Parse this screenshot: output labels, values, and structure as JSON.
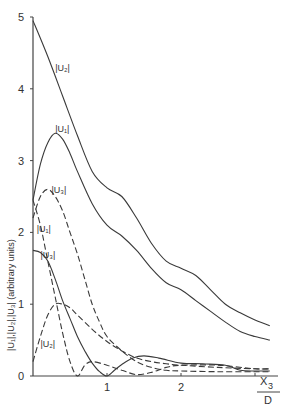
{
  "chart_data": {
    "type": "line",
    "title": "",
    "xlabel": "X3/D",
    "xlabel_numerator": "X",
    "xlabel_subscript": "3",
    "xlabel_denominator": "D",
    "ylabel": "|U1|,|U2|,|U3| (arbitrary units)",
    "ylabel_text": "|U₁|,|U₂|,|U₃| (arbitrary units)",
    "xlim": [
      0,
      3.3
    ],
    "ylim": [
      0,
      5
    ],
    "x_ticks": [
      0,
      1,
      2,
      3
    ],
    "x_tick_labels": [
      "",
      "1",
      "2",
      ""
    ],
    "y_ticks": [
      0,
      1,
      2,
      3,
      4,
      5
    ],
    "y_tick_labels": [
      "0",
      "1",
      "2",
      "3",
      "4",
      "5"
    ],
    "grid": false,
    "legend": "inline curve labels",
    "series": [
      {
        "name": "|U2| (upper solid)",
        "label": "|U₂|",
        "style": "solid",
        "label_pos": [
          0.3,
          4.25
        ],
        "x": [
          0,
          0.2,
          0.4,
          0.6,
          0.8,
          1.0,
          1.2,
          1.4,
          1.6,
          1.8,
          2.0,
          2.2,
          2.4,
          2.6,
          2.8,
          3.0,
          3.2
        ],
        "y": [
          4.95,
          4.45,
          3.9,
          3.35,
          2.85,
          2.62,
          2.5,
          2.2,
          1.85,
          1.6,
          1.5,
          1.4,
          1.2,
          1.0,
          0.88,
          0.78,
          0.7
        ]
      },
      {
        "name": "|U1| (lower solid)",
        "label": "|U₁|",
        "style": "solid",
        "label_pos": [
          0.3,
          3.4
        ],
        "x": [
          0,
          0.1,
          0.2,
          0.3,
          0.4,
          0.5,
          0.6,
          0.8,
          1.0,
          1.2,
          1.4,
          1.6,
          1.8,
          2.0,
          2.2,
          2.4,
          2.6,
          2.8,
          3.0,
          3.2
        ],
        "y": [
          2.45,
          2.95,
          3.25,
          3.38,
          3.3,
          3.1,
          2.85,
          2.4,
          2.1,
          1.95,
          1.75,
          1.5,
          1.3,
          1.2,
          1.05,
          0.9,
          0.75,
          0.62,
          0.55,
          0.5
        ]
      },
      {
        "name": "|U3| (upper dashed)",
        "label": "|U₃|",
        "style": "dashed",
        "label_pos": [
          0.25,
          2.55
        ],
        "x": [
          0,
          0.1,
          0.2,
          0.3,
          0.4,
          0.5,
          0.6,
          0.7,
          0.8,
          0.9,
          1.0,
          1.2,
          1.4,
          1.6,
          1.8,
          2.0,
          2.5,
          3.0,
          3.2
        ],
        "y": [
          2.2,
          2.5,
          2.6,
          2.5,
          2.3,
          2.0,
          1.7,
          1.35,
          1.0,
          0.75,
          0.55,
          0.35,
          0.2,
          0.12,
          0.08,
          0.07,
          0.06,
          0.06,
          0.06
        ]
      },
      {
        "name": "|U1| (lower dashed)",
        "label": "|U₁|",
        "style": "dashed",
        "label_pos": [
          0.05,
          2.0
        ],
        "x": [
          0,
          0.1,
          0.2,
          0.3,
          0.4,
          0.5,
          0.6,
          0.7,
          0.8,
          1.0,
          1.2,
          1.4,
          1.6,
          1.8,
          2.0,
          2.5,
          3.0,
          3.2
        ],
        "y": [
          2.45,
          2.1,
          1.6,
          1.1,
          0.6,
          0.2,
          0.0,
          0.15,
          0.2,
          0.15,
          0.08,
          0.02,
          0.05,
          0.12,
          0.15,
          0.15,
          0.1,
          0.1
        ]
      },
      {
        "name": "|U3| (solid, lower)",
        "label": "|U₃|",
        "style": "solid",
        "label_pos": [
          0.1,
          1.65
        ],
        "x": [
          0,
          0.1,
          0.2,
          0.3,
          0.4,
          0.5,
          0.6,
          0.7,
          0.8,
          0.9,
          1.0,
          1.1,
          1.2,
          1.35,
          1.5,
          1.7,
          2.0,
          2.3,
          2.6,
          2.8,
          3.0,
          3.2
        ],
        "y": [
          1.75,
          1.72,
          1.6,
          1.35,
          1.05,
          0.8,
          0.55,
          0.35,
          0.18,
          0.06,
          0.0,
          0.08,
          0.16,
          0.25,
          0.28,
          0.25,
          0.18,
          0.17,
          0.15,
          0.08,
          0.07,
          0.07
        ]
      },
      {
        "name": "|U2| (lower dashed)",
        "label": "|U₂|",
        "style": "dashed",
        "label_pos": [
          0.1,
          0.4
        ],
        "x": [
          0,
          0.1,
          0.2,
          0.3,
          0.4,
          0.5,
          0.6,
          0.8,
          1.0,
          1.2,
          1.4,
          1.6,
          1.8,
          2.0,
          2.5,
          3.0,
          3.2
        ],
        "y": [
          0.2,
          0.55,
          0.85,
          1.0,
          1.0,
          0.95,
          0.85,
          0.65,
          0.48,
          0.35,
          0.25,
          0.2,
          0.17,
          0.15,
          0.12,
          0.1,
          0.1
        ]
      }
    ]
  }
}
